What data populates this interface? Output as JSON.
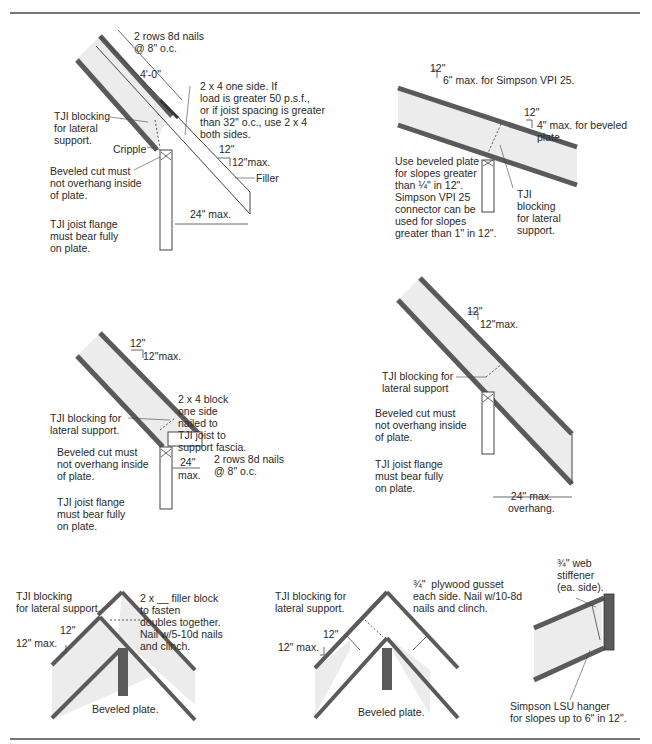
{
  "colors": {
    "flange": "#5a5a5a",
    "web_fill": "#ececec",
    "line": "#444444",
    "text": "#2a2a2a",
    "rule": "#777777"
  },
  "details": [
    {
      "id": "overhang-with-filler",
      "labels": {
        "nails": "2 rows 8d nails\n@ 8\" o.c.",
        "length": "4'-0\"",
        "two_by_four": "2 x 4 one side. If\nload is greater 50 p.s.f.,\nor if joist spacing is greater\nthan 32\" o.c., use 2 x 4\nboth sides.",
        "blocking": "TJI blocking\nfor lateral\nsupport.",
        "cripple": "Cripple",
        "slope_run": "12\"",
        "slope_rise": "12\"max.",
        "beveled": "Beveled cut must\nnot overhang inside\nof plate.",
        "flange": "TJI joist flange\nmust bear fully\non plate.",
        "filler": "Filler",
        "overhang": "24\" max."
      }
    },
    {
      "id": "low-slope-bearing",
      "labels": {
        "slope1_run": "12\"",
        "slope1_rise": "6\" max. for Simpson VPI 25.",
        "slope2_run": "12\"",
        "slope2_rise": "4\" max. for beveled\nplate.",
        "beveled_plate": "Use beveled plate\nfor slopes greater\nthan ¼\" in 12\".\nSimpson VPI 25\nconnector can be\nused for slopes\ngreater than 1\" in 12\".",
        "blocking": "TJI\nblocking\nfor lateral\nsupport."
      }
    },
    {
      "id": "overhang-with-fascia-block",
      "labels": {
        "slope_run": "12\"",
        "slope_rise": "12\"max.",
        "block": "2 x 4 block\none side\nnailed to\nTJI joist to\nsupport fascia.",
        "nails": "2 rows 8d nails\n@ 8\" o.c.",
        "blocking": "TJI blocking for\nlateral support.",
        "beveled": "Beveled cut must\nnot overhang inside\nof plate.",
        "flange": "TJI joist flange\nmust bear fully\non plate.",
        "overhang_top": "24\"",
        "overhang_bot": "max."
      }
    },
    {
      "id": "simple-overhang",
      "labels": {
        "slope_run": "12\"",
        "slope_rise": "12\"max.",
        "blocking": "TJI blocking for\nlateral support",
        "beveled": "Beveled cut must\nnot overhang inside\nof plate.",
        "flange": "TJI joist flange\nmust bear fully\non plate.",
        "overhang": "24\" max.\noverhang."
      }
    },
    {
      "id": "ridge-filler-block",
      "labels": {
        "blocking": "TJI blocking\nfor lateral support.",
        "filler": "2 x __ filler block\nto fasten\ndoubles together.\nNail w/5-10d nails\nand clinch.",
        "slope_run": "12\"",
        "slope_rise": "12\" max.",
        "plate": "Beveled plate."
      }
    },
    {
      "id": "ridge-plywood-gusset",
      "labels": {
        "blocking": "TJI blocking for\nlateral support.",
        "gusset": "¾\"  plywood gusset\neach side. Nail w/10-8d\nnails and clinch.",
        "slope_run": "12\"",
        "slope_rise": "12\" max.",
        "plate": "Beveled plate."
      }
    },
    {
      "id": "hanger-connection",
      "labels": {
        "stiffener": "¾\" web\nstiffener\n(ea. side).",
        "hanger": "Simpson LSU hanger\nfor slopes up to 6\" in 12\"."
      }
    }
  ]
}
